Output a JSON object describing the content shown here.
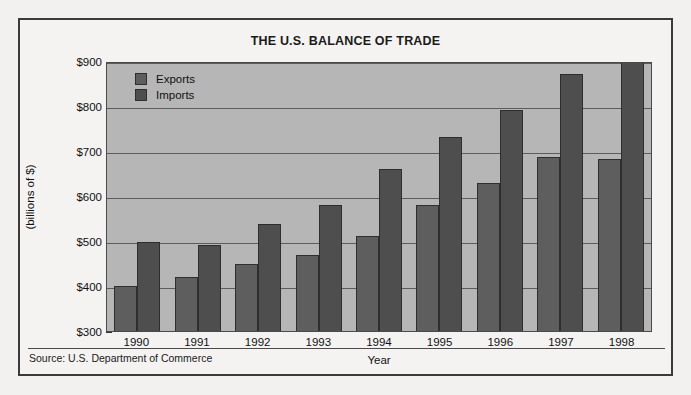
{
  "chart_data": {
    "type": "bar",
    "title": "THE U.S. BALANCE OF TRADE",
    "xlabel": "Year",
    "ylabel": "(billions of $)",
    "categories": [
      "1990",
      "1991",
      "1992",
      "1993",
      "1994",
      "1995",
      "1996",
      "1997",
      "1998"
    ],
    "series": [
      {
        "name": "Exports",
        "values": [
          401,
          420,
          449,
          470,
          512,
          581,
          630,
          687,
          682
        ],
        "color": "#5e5e5e"
      },
      {
        "name": "Imports",
        "values": [
          498,
          491,
          537,
          580,
          659,
          731,
          791,
          871,
          911
        ],
        "color": "#4e4e4e"
      }
    ],
    "ylim": [
      300,
      900
    ],
    "ytick_labels": [
      "$900",
      "$800",
      "$700",
      "$600",
      "$500",
      "$400",
      "$300"
    ],
    "ytick_values": [
      900,
      800,
      700,
      600,
      500,
      400,
      300
    ],
    "yminor_values": [
      850,
      750,
      650,
      550,
      450,
      350
    ],
    "grid": true,
    "legend_position": "top-left-inside",
    "source": "Source: U.S. Department of Commerce",
    "plot_background": "#b6b6b6",
    "figure_background": "#f4f3f1"
  }
}
